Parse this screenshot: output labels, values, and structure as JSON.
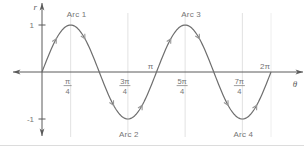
{
  "figure": {
    "background": "#ffffff",
    "border_bottom_color": "#dcdcdc"
  },
  "chart_data": {
    "type": "line",
    "function": "r = sin(2θ)",
    "x_axis_label": "θ",
    "y_axis_label": "r",
    "x_range_pi": [
      0,
      2
    ],
    "y_range": [
      -1,
      1
    ],
    "grid": true,
    "key_points_theta_pi": [
      0,
      0.25,
      0.5,
      0.75,
      1,
      1.25,
      1.5,
      1.75,
      2
    ],
    "key_points_r": [
      0,
      1,
      0,
      -1,
      0,
      1,
      0,
      -1,
      0
    ],
    "x_ticks": [
      {
        "theta_pi": 0.25,
        "style": "fraction",
        "num": "π",
        "den": "4",
        "side": "below"
      },
      {
        "theta_pi": 0.75,
        "style": "fraction",
        "num": "3π",
        "den": "4",
        "side": "below"
      },
      {
        "theta_pi": 1.0,
        "style": "plain",
        "label": "π",
        "side": "above"
      },
      {
        "theta_pi": 1.25,
        "style": "fraction",
        "num": "5π",
        "den": "4",
        "side": "below"
      },
      {
        "theta_pi": 1.75,
        "style": "fraction",
        "num": "7π",
        "den": "4",
        "side": "below"
      },
      {
        "theta_pi": 2.0,
        "style": "plain",
        "label": "2π",
        "side": "above"
      }
    ],
    "y_ticks": [
      {
        "r": 1,
        "label": "1"
      },
      {
        "r": -1,
        "label": "-1"
      }
    ],
    "gridlines_theta_pi": [
      0.25,
      0.75,
      1.25,
      1.75,
      2
    ],
    "annotations": [
      {
        "text": "Arc 1",
        "theta_pi": 0.25,
        "placement": "above"
      },
      {
        "text": "Arc 2",
        "theta_pi": 0.75,
        "placement": "below"
      },
      {
        "text": "Arc 3",
        "theta_pi": 1.25,
        "placement": "above"
      },
      {
        "text": "Arc 4",
        "theta_pi": 1.75,
        "placement": "below"
      }
    ],
    "direction_arrows_theta_pi": [
      0.125,
      0.375,
      0.625,
      0.875,
      1.125,
      1.375,
      1.625,
      1.875
    ],
    "colors": {
      "curve": "#6e6e6e",
      "axis": "#5a5a5a",
      "grid": "#dbdbdb",
      "curve_arrow": "#979797",
      "text": "#757575"
    }
  }
}
